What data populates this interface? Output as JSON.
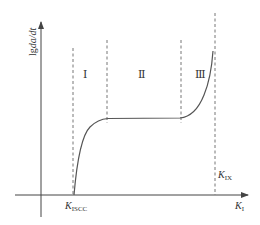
{
  "diagram": {
    "type": "fatigue-crack-growth-rate-curve",
    "colors": {
      "axis": "#444444",
      "curve": "#555555",
      "dashed": "#666666",
      "text": "#333333",
      "background": "#ffffff"
    },
    "y_axis": {
      "label_main": "lg",
      "label_expr": "da/dt"
    },
    "x_axis": {
      "label_main": "K",
      "label_sub": "I"
    },
    "regions": [
      {
        "id": "region-1",
        "label": "Ⅰ"
      },
      {
        "id": "region-2",
        "label": "Ⅱ"
      },
      {
        "id": "region-3",
        "label": "Ⅲ"
      }
    ],
    "thresholds": {
      "k_iscc": {
        "main": "K",
        "sub": "ISCC"
      },
      "k_ix": {
        "main": "K",
        "sub": "IX"
      }
    }
  }
}
